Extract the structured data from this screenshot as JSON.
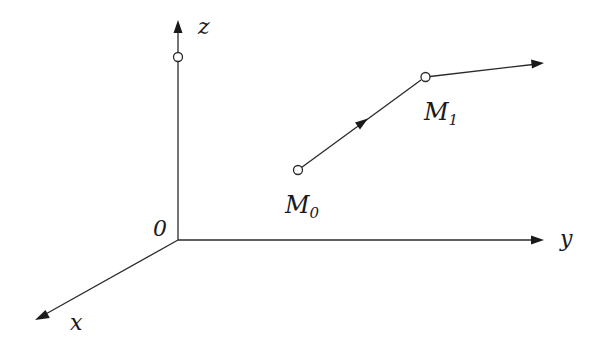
{
  "diagram": {
    "type": "3d-coordinate-system-trajectory",
    "axes": {
      "origin_label": "0",
      "x_label": "x",
      "y_label": "y",
      "z_label": "z"
    },
    "points": [
      {
        "id": "z-point",
        "label": ""
      },
      {
        "id": "M0",
        "label_main": "M",
        "label_sub": "0"
      },
      {
        "id": "M1",
        "label_main": "M",
        "label_sub": "1"
      }
    ],
    "path": [
      "M0",
      "M1",
      "continuation"
    ],
    "colors": {
      "stroke": "#2a2a2a",
      "background": "#ffffff"
    }
  }
}
